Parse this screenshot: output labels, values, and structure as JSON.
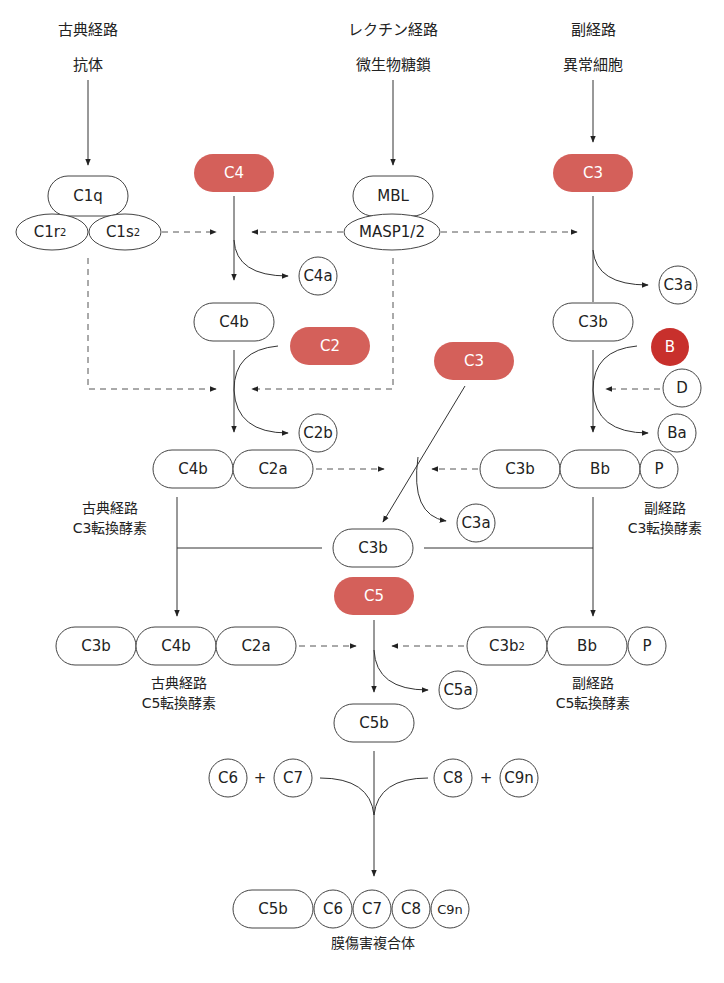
{
  "colors": {
    "substrate_red": "#d4605a",
    "factor_b_red": "#c8302c",
    "outline": "#444444",
    "line": "#333333"
  },
  "headers": {
    "classical": {
      "pathway": "古典経路",
      "trigger": "抗体"
    },
    "lectin": {
      "pathway": "レクチン経路",
      "trigger": "微生物糖鎖"
    },
    "alternative": {
      "pathway": "副経路",
      "trigger": "異常細胞"
    }
  },
  "nodes": {
    "c1q": "C1q",
    "c1r": "C1r",
    "c1r_sub": "2",
    "c1s": "C1s",
    "c1s_sub": "2",
    "c4": "C4",
    "mbl": "MBL",
    "masp": "MASP1/2",
    "c3_top": "C3",
    "c4a": "C4a",
    "c3a_top": "C3a",
    "c4b": "C4b",
    "c2": "C2",
    "c3b_alt": "C3b",
    "c3_mid": "C3",
    "b": "B",
    "d": "D",
    "c2b": "C2b",
    "ba": "Ba",
    "c3conv_classic": [
      "C4b",
      "C2a"
    ],
    "c3conv_alt": [
      "C3b",
      "Bb",
      "P"
    ],
    "c3a_mid": "C3a",
    "c3b_center": "C3b",
    "c5": "C5",
    "c5conv_classic": [
      "C3b",
      "C4b",
      "C2a"
    ],
    "c5conv_alt_c3b": "C3b",
    "c5conv_alt_sub": "2",
    "c5conv_alt": [
      "Bb",
      "P"
    ],
    "c5a": "C5a",
    "c5b": "C5b",
    "c6": "C6",
    "c7": "C7",
    "c8": "C8",
    "c9n": "C9n",
    "plus": "+",
    "mac": [
      "C5b",
      "C6",
      "C7",
      "C8",
      "C9n"
    ]
  },
  "labels": {
    "classic_c3_conv": {
      "line1": "古典経路",
      "line2": "C3転換酵素"
    },
    "alt_c3_conv": {
      "line1": "副経路",
      "line2": "C3転換酵素"
    },
    "classic_c5_conv": {
      "line1": "古典経路",
      "line2": "C5転換酵素"
    },
    "alt_c5_conv": {
      "line1": "副経路",
      "line2": "C5転換酵素"
    },
    "mac": "膜傷害複合体"
  }
}
